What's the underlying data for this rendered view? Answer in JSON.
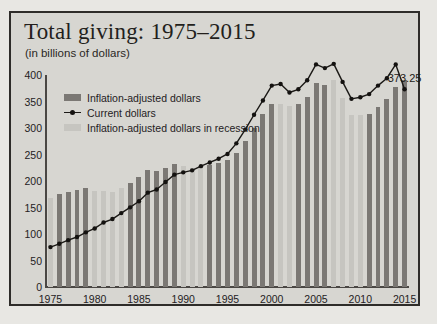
{
  "header": {
    "title": "Total giving: 1975–2015",
    "subtitle": "(in billions of dollars)"
  },
  "legend": [
    {
      "key": "inflation-adjusted",
      "label": "Inflation-adjusted dollars",
      "swatch": "dark-bar",
      "color": "#7b7874"
    },
    {
      "key": "current",
      "label": "Current dollars",
      "swatch": "line-marker",
      "color": "#141210"
    },
    {
      "key": "recession",
      "label": "Inflation-adjusted dollars in recession",
      "swatch": "light-bar",
      "color": "#c6c5c0"
    }
  ],
  "annotations": [
    {
      "name": "peak-value-label",
      "text": "373.25",
      "year": 2015,
      "value": 373.25
    }
  ],
  "colors": {
    "background": "#d7d6d1",
    "page_background": "#e8e7e3",
    "border": "#2e2c29",
    "bar_normal": "#7b7874",
    "bar_recession": "#c6c5c0",
    "line": "#1b1916",
    "axis": "#4a4744",
    "text": "#24211e"
  },
  "chart_data": {
    "type": "bar",
    "title": "Total giving: 1975–2015",
    "subtitle": "(in billions of dollars)",
    "xlabel": "",
    "ylabel": "",
    "ylim": [
      0,
      400
    ],
    "yticks": [
      0,
      50,
      100,
      150,
      200,
      250,
      300,
      350,
      400
    ],
    "xticks": [
      1975,
      1980,
      1985,
      1990,
      1995,
      2000,
      2005,
      2010,
      2015
    ],
    "grid": false,
    "legend_position": "upper-left",
    "categories": [
      1975,
      1976,
      1977,
      1978,
      1979,
      1980,
      1981,
      1982,
      1983,
      1984,
      1985,
      1986,
      1987,
      1988,
      1989,
      1990,
      1991,
      1992,
      1993,
      1994,
      1995,
      1996,
      1997,
      1998,
      1999,
      2000,
      2001,
      2002,
      2003,
      2004,
      2005,
      2006,
      2007,
      2008,
      2009,
      2010,
      2011,
      2012,
      2013,
      2014,
      2015
    ],
    "recession_years": [
      1975,
      1980,
      1981,
      1982,
      1983,
      1990,
      1991,
      1992,
      2001,
      2002,
      2007,
      2008,
      2009,
      2010
    ],
    "series": [
      {
        "name": "Inflation-adjusted dollars",
        "type": "bar",
        "values": [
          168,
          175,
          180,
          183,
          186,
          182,
          181,
          180,
          186,
          196,
          208,
          221,
          218,
          224,
          232,
          228,
          224,
          230,
          231,
          234,
          240,
          253,
          276,
          300,
          327,
          345,
          345,
          341,
          346,
          358,
          385,
          381,
          390,
          356,
          325,
          324,
          327,
          340,
          355,
          378,
          390
        ]
      },
      {
        "name": "Current dollars",
        "type": "line",
        "values": [
          75.3,
          81.5,
          88.4,
          94.3,
          103.1,
          110.5,
          121.7,
          128.2,
          139.4,
          150.3,
          161.8,
          178.0,
          184.0,
          198.0,
          212.0,
          216.3,
          220.1,
          228.0,
          235.0,
          242.0,
          251.0,
          271.0,
          297.0,
          325.0,
          352.0,
          380.0,
          383.0,
          367.0,
          373.0,
          390.0,
          420.0,
          413.0,
          421.0,
          387.0,
          355.0,
          358.0,
          364.0,
          380.0,
          394.0,
          420.0,
          373.25
        ]
      }
    ]
  }
}
